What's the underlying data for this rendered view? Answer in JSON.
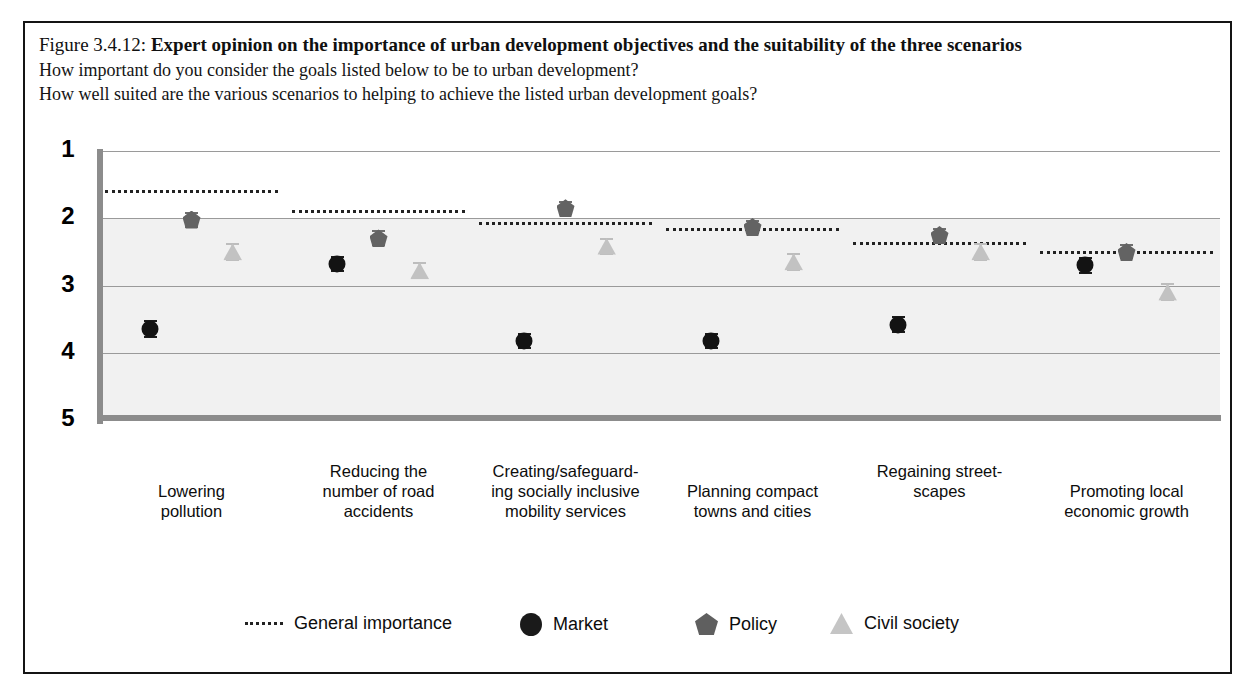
{
  "figure": {
    "number_label": "Figure 3.4.12:",
    "title": "Expert opinion on the importance of urban development objectives and the suitability of the three scenarios",
    "subtitle_1": "How important do you consider the goals listed below to be to urban development?",
    "subtitle_2": "How well suited are the various scenarios to helping to achieve the listed urban development goals?"
  },
  "legend": {
    "items": [
      {
        "key": "general-importance",
        "label": "General importance",
        "marker": "dotted-line",
        "color": "#222222"
      },
      {
        "key": "market",
        "label": "Market",
        "marker": "circle",
        "color": "#1a1a1a"
      },
      {
        "key": "policy",
        "label": "Policy",
        "marker": "pentagon",
        "color": "#5f5f5f"
      },
      {
        "key": "civil-society",
        "label": "Civil society",
        "marker": "triangle",
        "color": "#c5c5c5"
      }
    ]
  },
  "axis": {
    "y_ticks": [
      "1",
      "2",
      "3",
      "4",
      "5"
    ],
    "y_min": 1,
    "y_max": 5
  },
  "chart_data": {
    "type": "scatter",
    "title": "Expert opinion on the importance of urban development objectives and the suitability of the three scenarios",
    "xlabel": "",
    "ylabel": "",
    "ylim": [
      1,
      5
    ],
    "y_inverted": true,
    "grid": true,
    "legend_position": "bottom",
    "categories": [
      "Lowering pollution",
      "Reducing the number of road accidents",
      "Creating/safeguarding socially inclusive mobility services",
      "Planning compact towns and cities",
      "Regaining streetscapes",
      "Promoting local economic growth"
    ],
    "category_lines": [
      [
        "Lowering",
        "pollution"
      ],
      [
        "Reducing the",
        "number of road",
        "accidents"
      ],
      [
        "Creating/safeguard-",
        "ing socially inclusive",
        "mobility services"
      ],
      [
        "Planning compact",
        "towns and cities"
      ],
      [
        "Regaining street-",
        "scapes"
      ],
      [
        "Promoting local",
        "economic growth"
      ]
    ],
    "series": [
      {
        "name": "General importance",
        "type": "step-line",
        "values": [
          1.58,
          1.88,
          2.06,
          2.14,
          2.35,
          2.48
        ]
      },
      {
        "name": "Market",
        "type": "point",
        "values": [
          3.65,
          2.68,
          3.83,
          3.82,
          3.58,
          2.7
        ],
        "errors": [
          0.13,
          0.12,
          0.12,
          0.12,
          0.13,
          0.13
        ]
      },
      {
        "name": "Policy",
        "type": "point",
        "values": [
          2.02,
          2.3,
          1.85,
          2.13,
          2.25,
          2.5
        ],
        "errors": [
          0.12,
          0.12,
          0.1,
          0.11,
          0.11,
          0.11
        ]
      },
      {
        "name": "Civil society",
        "type": "point",
        "values": [
          2.5,
          2.78,
          2.42,
          2.65,
          2.5,
          3.1
        ],
        "errors": [
          0.13,
          0.13,
          0.13,
          0.13,
          0.13,
          0.13
        ]
      }
    ]
  }
}
